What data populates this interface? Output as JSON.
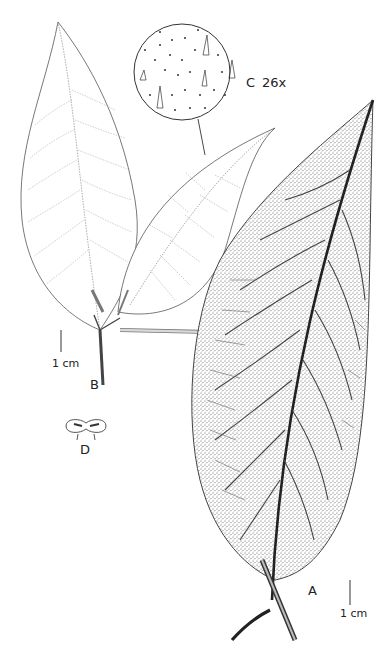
{
  "figure": {
    "type": "botanical illustration plate",
    "panels": [
      {
        "id": "A",
        "label": "A",
        "description": "Leaf, abaxial surface, densely pubescent with stipules and petiole"
      },
      {
        "id": "B",
        "label": "B",
        "description": "Leafy branch tip, adaxial surface"
      },
      {
        "id": "C",
        "label": "C",
        "magnification": "26x",
        "description": "Detail of leaf surface trichomes"
      },
      {
        "id": "D",
        "label": "D",
        "description": "Cross-section / detail structure"
      }
    ],
    "labels": {
      "a": "A",
      "b": "B",
      "c": "C",
      "c_mag": "26x",
      "d": "D"
    },
    "scale_bars": [
      {
        "panel": "B",
        "text": "1 cm"
      },
      {
        "panel": "A",
        "text": "1 cm"
      }
    ],
    "colors": {
      "ink": "#2a2a2a",
      "light_ink": "#8a8a8a",
      "stipple": "#555555",
      "background": "#ffffff"
    }
  }
}
